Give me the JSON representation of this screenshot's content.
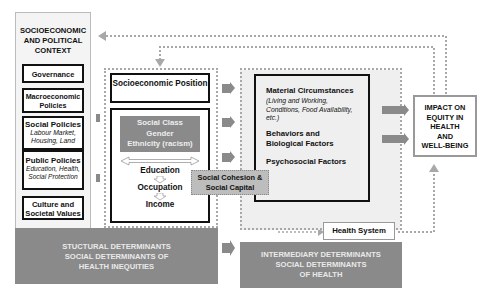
{
  "context": {
    "title": "SOCIOECONOMIC AND POLITICAL CONTEXT",
    "items": [
      {
        "title": "Governance",
        "sub": ""
      },
      {
        "title": "Macroeconomic Policies",
        "sub": ""
      },
      {
        "title": "Social Policies",
        "sub": "Labour Market, Housing, Land"
      },
      {
        "title": "Public Policies",
        "sub": "Education, Health, Social Protection"
      },
      {
        "title": "Culture and Societal Values",
        "sub": ""
      }
    ]
  },
  "structural": {
    "position_title": "Socioeconomic Position",
    "stratifiers": [
      "Social Class",
      "Gender",
      "Ethnicity (racism)"
    ],
    "ladder": [
      "Education",
      "Occupation",
      "Income"
    ],
    "banner": [
      "STUCTURAL DETERMINANTS",
      "SOCIAL DETERMINANTS OF",
      "HEALTH INEQUITIES"
    ]
  },
  "cohesion": {
    "label": "Social Cohesion & Social Capital"
  },
  "intermediary": {
    "factors": [
      {
        "title": "Material Circumstances",
        "sub": "(Living and Working, Conditions, Food Availability, etc.)"
      },
      {
        "title": "Behaviors and Biological Factors",
        "sub": ""
      },
      {
        "title": "Psychosocial Factors",
        "sub": ""
      }
    ],
    "health_system": "Health System",
    "banner": [
      "INTERMEDIARY DETERMINANTS",
      "SOCIAL DETERMINANTS",
      "OF HEALTH"
    ]
  },
  "impact": {
    "lines": [
      "IMPACT ON",
      "EQUITY IN",
      "HEALTH",
      "AND",
      "WELL-BEING"
    ]
  },
  "colors": {
    "banner": "#8a8a8a",
    "dotted": "#a8a8a8",
    "border": "#111111",
    "stratifier_bg": "#8a8a8a",
    "cohesion_bg": "#bdbdbd"
  }
}
